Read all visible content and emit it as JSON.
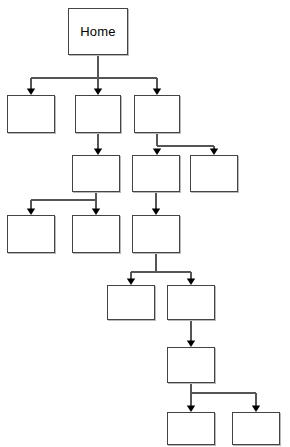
{
  "diagram": {
    "type": "sitemap-tree",
    "title": "",
    "canvas": {
      "width": 290,
      "height": 447
    },
    "style": {
      "box_fill": "#ffffff",
      "box_stroke": "#444444",
      "box_shadow": "#b9b9b9",
      "connector_stroke": "#555555",
      "arrowhead_fill": "#000000",
      "background": "#ffffff",
      "label_color": "#000000"
    },
    "nodes": [
      {
        "id": "n1",
        "label": "Home",
        "level": 1,
        "x": 68,
        "y": 8,
        "w": 60,
        "h": 47
      },
      {
        "id": "n2",
        "label": "",
        "level": 2,
        "x": 7,
        "y": 95,
        "w": 48,
        "h": 38
      },
      {
        "id": "n3",
        "label": "",
        "level": 2,
        "x": 75,
        "y": 95,
        "w": 46,
        "h": 38
      },
      {
        "id": "n4",
        "label": "",
        "level": 2,
        "x": 134,
        "y": 95,
        "w": 46,
        "h": 38
      },
      {
        "id": "n5",
        "label": "",
        "level": 3,
        "x": 72,
        "y": 155,
        "w": 48,
        "h": 37
      },
      {
        "id": "n6",
        "label": "",
        "level": 3,
        "x": 132,
        "y": 155,
        "w": 48,
        "h": 37
      },
      {
        "id": "n7",
        "label": "",
        "level": 3,
        "x": 190,
        "y": 155,
        "w": 48,
        "h": 37
      },
      {
        "id": "n8",
        "label": "",
        "level": 4,
        "x": 7,
        "y": 215,
        "w": 48,
        "h": 38
      },
      {
        "id": "n9",
        "label": "",
        "level": 4,
        "x": 72,
        "y": 215,
        "w": 48,
        "h": 38
      },
      {
        "id": "n10",
        "label": "",
        "level": 4,
        "x": 132,
        "y": 215,
        "w": 48,
        "h": 38
      },
      {
        "id": "n11",
        "label": "",
        "level": 5,
        "x": 107,
        "y": 285,
        "w": 48,
        "h": 35
      },
      {
        "id": "n12",
        "label": "",
        "level": 5,
        "x": 167,
        "y": 285,
        "w": 48,
        "h": 35
      },
      {
        "id": "n13",
        "label": "",
        "level": 6,
        "x": 167,
        "y": 347,
        "w": 48,
        "h": 36
      },
      {
        "id": "n14",
        "label": "",
        "level": 7,
        "x": 167,
        "y": 412,
        "w": 48,
        "h": 33
      },
      {
        "id": "n15",
        "label": "",
        "level": 7,
        "x": 232,
        "y": 412,
        "w": 48,
        "h": 33
      }
    ],
    "edges": [
      {
        "from": "n1",
        "to": "n2"
      },
      {
        "from": "n1",
        "to": "n3"
      },
      {
        "from": "n1",
        "to": "n4"
      },
      {
        "from": "n3",
        "to": "n5"
      },
      {
        "from": "n4",
        "to": "n6"
      },
      {
        "from": "n4",
        "to": "n7"
      },
      {
        "from": "n5",
        "to": "n8"
      },
      {
        "from": "n5",
        "to": "n9"
      },
      {
        "from": "n6",
        "to": "n10"
      },
      {
        "from": "n10",
        "to": "n11"
      },
      {
        "from": "n10",
        "to": "n12"
      },
      {
        "from": "n12",
        "to": "n13"
      },
      {
        "from": "n13",
        "to": "n14"
      },
      {
        "from": "n13",
        "to": "n15"
      }
    ],
    "connector_paths": [
      "M98,55 L98,78 M31,78 L157,78 M31,78 L31,89 M98,78 L98,89 M157,78 L157,89",
      "M98,133 L98,149",
      "M157,133 L157,146 M157,146 L214,146 M214,146 L214,149",
      "M96,192 L96,200 M31,200 L96,200 M31,200 L31,209 M96,200 L96,209",
      "M156,192 L156,209",
      "M156,253 L156,272 M131,272 L191,272 M131,272 L131,279 M191,272 L191,279",
      "M191,320 L191,341",
      "M191,383 L191,393 M191,393 L256,393 M191,393 L191,406 M256,393 L256,406"
    ],
    "arrowheads": [
      {
        "x": 31,
        "y": 95
      },
      {
        "x": 98,
        "y": 95
      },
      {
        "x": 157,
        "y": 95
      },
      {
        "x": 98,
        "y": 155
      },
      {
        "x": 157,
        "y": 155
      },
      {
        "x": 214,
        "y": 155
      },
      {
        "x": 31,
        "y": 215
      },
      {
        "x": 96,
        "y": 215
      },
      {
        "x": 156,
        "y": 215
      },
      {
        "x": 131,
        "y": 285
      },
      {
        "x": 191,
        "y": 285
      },
      {
        "x": 191,
        "y": 347
      },
      {
        "x": 191,
        "y": 412
      },
      {
        "x": 256,
        "y": 412
      }
    ]
  }
}
